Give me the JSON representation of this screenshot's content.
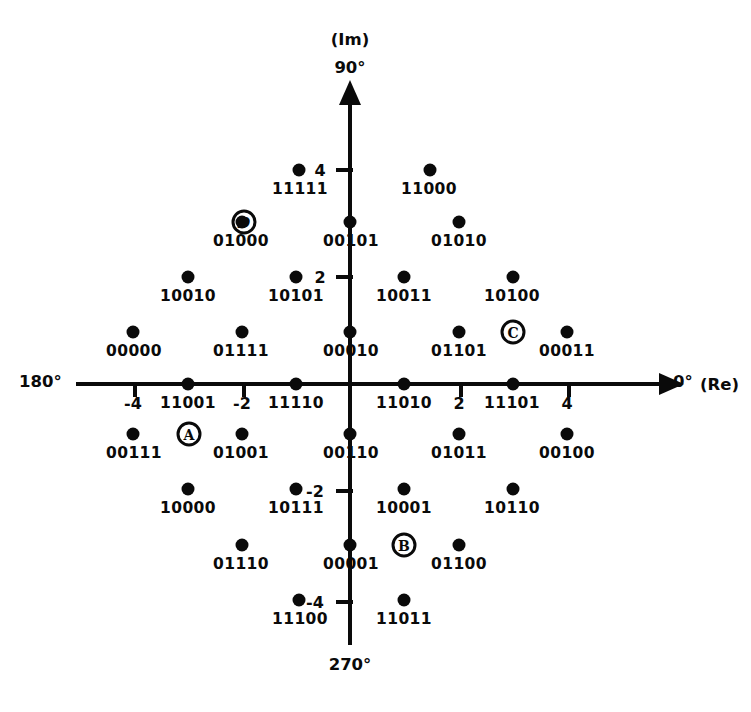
{
  "axes": {
    "imaginary_caption": "(Im)",
    "angle_top": "90°",
    "angle_bottom": "270°",
    "angle_left": "180°",
    "angle_right": "0°",
    "real_caption": "(Re)",
    "x_ticks": [
      "-4",
      "-2",
      "2",
      "4"
    ],
    "y_ticks": [
      "4",
      "2",
      "-2",
      "-4"
    ],
    "color": "#0a0a0a"
  },
  "markers": [
    {
      "label": "A",
      "italic": false
    },
    {
      "label": "B",
      "italic": false
    },
    {
      "label": "C",
      "italic": false
    },
    {
      "label": "D",
      "italic": true
    }
  ],
  "chart_data": {
    "type": "scatter",
    "xlabel": "(Re)",
    "ylabel": "(Im)",
    "xlim": [
      -6,
      6
    ],
    "ylim": [
      -6,
      6
    ],
    "xticks": [
      -4,
      -2,
      2,
      4
    ],
    "yticks": [
      4,
      2,
      -2,
      -4
    ],
    "grid": false,
    "legend": null,
    "point_count": 32,
    "points": [
      {
        "label": "11111",
        "x": -1,
        "y": 5
      },
      {
        "label": "11000",
        "x": 1,
        "y": 5
      },
      {
        "label": "01000",
        "x": -3,
        "y": 3
      },
      {
        "label": "00101",
        "x": -1,
        "y": 3
      },
      {
        "label": "01010",
        "x": 3,
        "y": 3
      },
      {
        "label": "10010",
        "x": -5,
        "y": 1
      },
      {
        "label": "10101",
        "x": -3,
        "y": 1
      },
      {
        "label": "10011",
        "x": 1,
        "y": 1
      },
      {
        "label": "10100",
        "x": 3,
        "y": 1
      },
      {
        "label": "00000",
        "x": -7,
        "y": 0
      },
      {
        "label": "01111",
        "x": -4,
        "y": 0
      },
      {
        "label": "00010",
        "x": -1,
        "y": 0
      },
      {
        "label": "01101",
        "x": 2,
        "y": 0
      },
      {
        "label": "00011",
        "x": 5,
        "y": 0
      },
      {
        "label": "11001",
        "x": -3,
        "y": 0
      },
      {
        "label": "11110",
        "x": -1,
        "y": 0
      },
      {
        "label": "11010",
        "x": 1,
        "y": 0
      },
      {
        "label": "11101",
        "x": 3,
        "y": 0
      },
      {
        "label": "00111",
        "x": -6,
        "y": -1
      },
      {
        "label": "01001",
        "x": -3,
        "y": -1
      },
      {
        "label": "00110",
        "x": -1,
        "y": -1
      },
      {
        "label": "01011",
        "x": 1,
        "y": -1
      },
      {
        "label": "00100",
        "x": 4,
        "y": -1
      },
      {
        "label": "10000",
        "x": -4,
        "y": -3
      },
      {
        "label": "10111",
        "x": -1,
        "y": -3
      },
      {
        "label": "10001",
        "x": 1,
        "y": -3
      },
      {
        "label": "10110",
        "x": 3,
        "y": -3
      },
      {
        "label": "01110",
        "x": -3,
        "y": -5
      },
      {
        "label": "00001",
        "x": -1,
        "y": -5
      },
      {
        "label": "01100",
        "x": 2,
        "y": -5
      },
      {
        "label": "11100",
        "x": -1,
        "y": -7
      },
      {
        "label": "11011",
        "x": 1,
        "y": -7
      }
    ],
    "annotations": [
      {
        "text": "A",
        "note": "circled region marker, lower-left quadrant"
      },
      {
        "text": "B",
        "note": "circled region marker, lower-right of origin"
      },
      {
        "text": "C",
        "note": "circled region marker, upper-right quadrant"
      },
      {
        "text": "D",
        "note": "circled region marker, upper-left quadrant, italic"
      }
    ]
  },
  "points": [
    {
      "label": "11111",
      "dx": 299,
      "dy": 170,
      "lx": 300,
      "ly": 180
    },
    {
      "label": "11000",
      "dx": 430,
      "dy": 170,
      "lx": 429,
      "ly": 180
    },
    {
      "label": "01000",
      "dx": 242,
      "dy": 222,
      "lx": 241,
      "ly": 232
    },
    {
      "label": "00101",
      "dx": 350,
      "dy": 222,
      "lx": 351,
      "ly": 232
    },
    {
      "label": "01010",
      "dx": 459,
      "dy": 222,
      "lx": 459,
      "ly": 232
    },
    {
      "label": "10010",
      "dx": 188,
      "dy": 277,
      "lx": 188,
      "ly": 287
    },
    {
      "label": "10101",
      "dx": 296,
      "dy": 277,
      "lx": 296,
      "ly": 287
    },
    {
      "label": "10011",
      "dx": 404,
      "dy": 277,
      "lx": 404,
      "ly": 287
    },
    {
      "label": "10100",
      "dx": 513,
      "dy": 277,
      "lx": 512,
      "ly": 287
    },
    {
      "label": "00000",
      "dx": 133,
      "dy": 332,
      "lx": 134,
      "ly": 342
    },
    {
      "label": "01111",
      "dx": 242,
      "dy": 332,
      "lx": 241,
      "ly": 342
    },
    {
      "label": "00010",
      "dx": 350,
      "dy": 332,
      "lx": 351,
      "ly": 342
    },
    {
      "label": "01101",
      "dx": 459,
      "dy": 332,
      "lx": 459,
      "ly": 342
    },
    {
      "label": "00011",
      "dx": 567,
      "dy": 332,
      "lx": 567,
      "ly": 342
    },
    {
      "label": "11001",
      "dx": 188,
      "dy": 384,
      "lx": 188,
      "ly": 394
    },
    {
      "label": "11110",
      "dx": 296,
      "dy": 384,
      "lx": 296,
      "ly": 394
    },
    {
      "label": "11010",
      "dx": 404,
      "dy": 384,
      "lx": 404,
      "ly": 394
    },
    {
      "label": "11101",
      "dx": 513,
      "dy": 384,
      "lx": 512,
      "ly": 394
    },
    {
      "label": "00111",
      "dx": 133,
      "dy": 434,
      "lx": 134,
      "ly": 444
    },
    {
      "label": "01001",
      "dx": 242,
      "dy": 434,
      "lx": 241,
      "ly": 444
    },
    {
      "label": "00110",
      "dx": 350,
      "dy": 434,
      "lx": 351,
      "ly": 444
    },
    {
      "label": "01011",
      "dx": 459,
      "dy": 434,
      "lx": 459,
      "ly": 444
    },
    {
      "label": "00100",
      "dx": 567,
      "dy": 434,
      "lx": 567,
      "ly": 444
    },
    {
      "label": "10000",
      "dx": 188,
      "dy": 489,
      "lx": 188,
      "ly": 499
    },
    {
      "label": "10111",
      "dx": 296,
      "dy": 489,
      "lx": 296,
      "ly": 499
    },
    {
      "label": "10001",
      "dx": 404,
      "dy": 489,
      "lx": 404,
      "ly": 499
    },
    {
      "label": "10110",
      "dx": 513,
      "dy": 489,
      "lx": 512,
      "ly": 499
    },
    {
      "label": "01110",
      "dx": 242,
      "dy": 545,
      "lx": 241,
      "ly": 555
    },
    {
      "label": "00001",
      "dx": 350,
      "dy": 545,
      "lx": 351,
      "ly": 555
    },
    {
      "label": "01100",
      "dx": 459,
      "dy": 545,
      "lx": 459,
      "ly": 555
    },
    {
      "label": "11100",
      "dx": 299,
      "dy": 600,
      "lx": 300,
      "ly": 610
    },
    {
      "label": "11011",
      "dx": 404,
      "dy": 600,
      "lx": 404,
      "ly": 610
    }
  ]
}
